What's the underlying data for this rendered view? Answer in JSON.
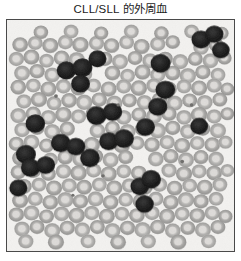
{
  "figure": {
    "caption": "CLL/SLL 的外周血",
    "caption_color": "#1c1c1c",
    "background_color": "#ffffff"
  },
  "micrograph": {
    "name": "peripheral-blood-smear",
    "modality": "light-microscopy",
    "stain": "Wright-Giemsa (grayscale reproduction)",
    "border_color": "#4a4a4a",
    "field_background_color": "#f2f1ef",
    "panel": {
      "x": 6,
      "y": 19,
      "width": 229,
      "height": 233
    },
    "palette": {
      "rbc_rim": "#b0afad",
      "rbc_rim_dark": "#9a9997",
      "rbc_center": "#dedcd9",
      "lymphocyte_dark": "#1e1e1e",
      "lymphocyte_mid": "#2e2e2e",
      "platelet": "#6e6d6b"
    },
    "cell_counts": {
      "erythrocytes": 196,
      "lymphocytes": 24,
      "platelets": 6
    },
    "erythrocytes": [
      [
        14,
        28,
        8.4
      ],
      [
        30,
        26,
        8.0
      ],
      [
        46,
        29,
        8.6
      ],
      [
        62,
        25,
        8.2
      ],
      [
        78,
        28,
        8.8
      ],
      [
        95,
        26,
        8.2
      ],
      [
        111,
        29,
        8.4
      ],
      [
        127,
        25,
        8.0
      ],
      [
        143,
        30,
        8.6
      ],
      [
        160,
        27,
        8.2
      ],
      [
        176,
        25,
        7.8
      ],
      [
        206,
        31,
        8.4
      ],
      [
        222,
        28,
        8.0
      ],
      [
        10,
        44,
        8.2
      ],
      [
        26,
        42,
        8.6
      ],
      [
        42,
        46,
        8.0
      ],
      [
        58,
        43,
        8.4
      ],
      [
        74,
        45,
        8.8
      ],
      [
        104,
        44,
        8.2
      ],
      [
        120,
        47,
        8.6
      ],
      [
        136,
        43,
        8.0
      ],
      [
        152,
        46,
        8.4
      ],
      [
        168,
        44,
        8.2
      ],
      [
        184,
        47,
        8.6
      ],
      [
        200,
        44,
        8.0
      ],
      [
        216,
        46,
        8.4
      ],
      [
        231,
        43,
        7.6
      ],
      [
        16,
        60,
        8.6
      ],
      [
        32,
        58,
        8.2
      ],
      [
        48,
        62,
        8.4
      ],
      [
        64,
        59,
        8.0
      ],
      [
        82,
        61,
        8.6
      ],
      [
        112,
        60,
        8.4
      ],
      [
        128,
        63,
        8.0
      ],
      [
        144,
        59,
        8.6
      ],
      [
        160,
        62,
        8.2
      ],
      [
        176,
        60,
        8.4
      ],
      [
        192,
        63,
        8.8
      ],
      [
        208,
        59,
        8.2
      ],
      [
        224,
        62,
        8.0
      ],
      [
        12,
        76,
        8.4
      ],
      [
        28,
        74,
        8.0
      ],
      [
        44,
        78,
        8.6
      ],
      [
        60,
        75,
        8.2
      ],
      [
        76,
        77,
        8.4
      ],
      [
        92,
        74,
        8.0
      ],
      [
        108,
        78,
        8.6
      ],
      [
        124,
        75,
        8.2
      ],
      [
        140,
        77,
        8.8
      ],
      [
        156,
        74,
        8.2
      ],
      [
        172,
        78,
        8.4
      ],
      [
        188,
        75,
        8.0
      ],
      [
        204,
        77,
        8.6
      ],
      [
        220,
        74,
        8.2
      ],
      [
        234,
        78,
        7.4
      ],
      [
        18,
        92,
        8.2
      ],
      [
        34,
        90,
        8.6
      ],
      [
        50,
        94,
        8.0
      ],
      [
        66,
        91,
        8.4
      ],
      [
        82,
        93,
        8.8
      ],
      [
        98,
        90,
        8.2
      ],
      [
        114,
        94,
        8.6
      ],
      [
        130,
        91,
        8.0
      ],
      [
        146,
        93,
        8.4
      ],
      [
        162,
        90,
        8.2
      ],
      [
        178,
        94,
        8.6
      ],
      [
        194,
        91,
        8.0
      ],
      [
        210,
        93,
        8.4
      ],
      [
        226,
        90,
        8.0
      ],
      [
        12,
        108,
        8.6
      ],
      [
        28,
        106,
        8.2
      ],
      [
        44,
        110,
        8.4
      ],
      [
        60,
        107,
        8.8
      ],
      [
        76,
        109,
        8.2
      ],
      [
        92,
        106,
        8.6
      ],
      [
        124,
        110,
        8.4
      ],
      [
        140,
        107,
        8.0
      ],
      [
        156,
        109,
        8.6
      ],
      [
        172,
        106,
        8.2
      ],
      [
        188,
        110,
        8.4
      ],
      [
        204,
        107,
        8.8
      ],
      [
        220,
        109,
        8.2
      ],
      [
        234,
        106,
        7.4
      ],
      [
        16,
        124,
        8.4
      ],
      [
        32,
        122,
        8.0
      ],
      [
        48,
        126,
        8.6
      ],
      [
        64,
        123,
        8.2
      ],
      [
        96,
        125,
        8.4
      ],
      [
        112,
        122,
        8.0
      ],
      [
        128,
        126,
        8.6
      ],
      [
        144,
        123,
        8.2
      ],
      [
        160,
        125,
        8.8
      ],
      [
        176,
        122,
        8.2
      ],
      [
        192,
        126,
        8.4
      ],
      [
        208,
        123,
        8.0
      ],
      [
        224,
        125,
        8.6
      ],
      [
        10,
        140,
        8.2
      ],
      [
        26,
        138,
        8.6
      ],
      [
        42,
        142,
        8.0
      ],
      [
        58,
        139,
        8.4
      ],
      [
        90,
        141,
        8.8
      ],
      [
        106,
        138,
        8.2
      ],
      [
        122,
        142,
        8.6
      ],
      [
        138,
        139,
        8.0
      ],
      [
        154,
        141,
        8.4
      ],
      [
        170,
        138,
        8.2
      ],
      [
        186,
        142,
        8.6
      ],
      [
        202,
        139,
        8.0
      ],
      [
        218,
        141,
        8.4
      ],
      [
        232,
        138,
        7.6
      ],
      [
        14,
        156,
        8.6
      ],
      [
        46,
        158,
        8.2
      ],
      [
        62,
        155,
        8.4
      ],
      [
        78,
        157,
        8.8
      ],
      [
        94,
        154,
        8.2
      ],
      [
        110,
        158,
        8.6
      ],
      [
        126,
        155,
        8.0
      ],
      [
        158,
        157,
        8.4
      ],
      [
        174,
        154,
        8.2
      ],
      [
        190,
        158,
        8.6
      ],
      [
        206,
        155,
        8.0
      ],
      [
        222,
        157,
        8.4
      ],
      [
        12,
        172,
        8.2
      ],
      [
        28,
        170,
        8.6
      ],
      [
        44,
        174,
        8.0
      ],
      [
        60,
        171,
        8.4
      ],
      [
        76,
        173,
        8.8
      ],
      [
        92,
        170,
        8.2
      ],
      [
        108,
        174,
        8.6
      ],
      [
        124,
        171,
        8.0
      ],
      [
        140,
        173,
        8.4
      ],
      [
        172,
        170,
        8.2
      ],
      [
        188,
        174,
        8.6
      ],
      [
        204,
        171,
        8.0
      ],
      [
        220,
        173,
        8.4
      ],
      [
        234,
        170,
        7.4
      ],
      [
        18,
        188,
        8.4
      ],
      [
        34,
        186,
        8.0
      ],
      [
        50,
        190,
        8.6
      ],
      [
        66,
        187,
        8.2
      ],
      [
        82,
        189,
        8.4
      ],
      [
        98,
        186,
        8.0
      ],
      [
        114,
        190,
        8.6
      ],
      [
        130,
        187,
        8.2
      ],
      [
        146,
        189,
        8.8
      ],
      [
        162,
        186,
        8.2
      ],
      [
        178,
        190,
        8.4
      ],
      [
        194,
        187,
        8.0
      ],
      [
        210,
        189,
        8.6
      ],
      [
        226,
        186,
        8.0
      ],
      [
        14,
        204,
        8.6
      ],
      [
        30,
        202,
        8.2
      ],
      [
        46,
        206,
        8.4
      ],
      [
        62,
        203,
        8.8
      ],
      [
        78,
        205,
        8.2
      ],
      [
        94,
        202,
        8.6
      ],
      [
        110,
        206,
        8.4
      ],
      [
        126,
        203,
        8.0
      ],
      [
        142,
        205,
        8.6
      ],
      [
        158,
        202,
        8.2
      ],
      [
        174,
        206,
        8.4
      ],
      [
        190,
        203,
        8.8
      ],
      [
        206,
        205,
        8.2
      ],
      [
        222,
        202,
        8.0
      ],
      [
        10,
        220,
        8.2
      ],
      [
        26,
        218,
        8.6
      ],
      [
        42,
        222,
        8.0
      ],
      [
        58,
        219,
        8.4
      ],
      [
        74,
        221,
        8.8
      ],
      [
        90,
        218,
        8.2
      ],
      [
        106,
        222,
        8.6
      ],
      [
        122,
        219,
        8.0
      ],
      [
        138,
        221,
        8.4
      ],
      [
        154,
        218,
        8.2
      ],
      [
        170,
        222,
        8.6
      ],
      [
        186,
        219,
        8.0
      ],
      [
        202,
        221,
        8.4
      ],
      [
        218,
        218,
        8.2
      ],
      [
        232,
        222,
        7.6
      ],
      [
        16,
        236,
        8.4
      ],
      [
        32,
        234,
        8.0
      ],
      [
        48,
        238,
        8.6
      ],
      [
        64,
        235,
        8.2
      ],
      [
        80,
        237,
        8.4
      ],
      [
        96,
        234,
        8.0
      ],
      [
        112,
        238,
        8.6
      ],
      [
        128,
        235,
        8.2
      ],
      [
        144,
        237,
        8.8
      ],
      [
        160,
        234,
        8.2
      ],
      [
        176,
        238,
        8.4
      ],
      [
        192,
        235,
        8.0
      ],
      [
        208,
        237,
        8.6
      ],
      [
        224,
        234,
        8.0
      ],
      [
        20,
        250,
        8.2
      ],
      [
        52,
        251,
        8.6
      ],
      [
        86,
        250,
        8.0
      ],
      [
        118,
        251,
        8.4
      ],
      [
        150,
        250,
        8.2
      ],
      [
        182,
        251,
        8.6
      ],
      [
        214,
        250,
        8.0
      ],
      [
        36,
        14,
        7.8
      ],
      [
        68,
        13,
        8.0
      ],
      [
        100,
        15,
        7.6
      ],
      [
        132,
        13,
        8.0
      ],
      [
        164,
        15,
        7.8
      ],
      [
        196,
        13,
        8.0
      ],
      [
        228,
        15,
        7.4
      ]
    ],
    "lymphocytes": [
      [
        63,
        57,
        10.2
      ],
      [
        80,
        54,
        10.6
      ],
      [
        78,
        72,
        10.0
      ],
      [
        30,
        117,
        10.4
      ],
      [
        96,
        44,
        9.6
      ],
      [
        206,
        22,
        10.2
      ],
      [
        220,
        16,
        9.8
      ],
      [
        227,
        34,
        9.4
      ],
      [
        163,
        49,
        10.6
      ],
      [
        168,
        79,
        10.4
      ],
      [
        160,
        98,
        10.2
      ],
      [
        147,
        121,
        10.0
      ],
      [
        95,
        108,
        10.6
      ],
      [
        112,
        104,
        10.2
      ],
      [
        57,
        139,
        10.4
      ],
      [
        73,
        143,
        10.0
      ],
      [
        20,
        152,
        10.6
      ],
      [
        25,
        167,
        10.2
      ],
      [
        41,
        164,
        10.0
      ],
      [
        88,
        156,
        10.4
      ],
      [
        108,
        137,
        10.2
      ],
      [
        124,
        134,
        10.6
      ],
      [
        141,
        188,
        10.0
      ],
      [
        153,
        180,
        10.4
      ],
      [
        146,
        208,
        9.8
      ],
      [
        12,
        190,
        9.6
      ],
      [
        204,
        120,
        9.4
      ]
    ],
    "platelets": [
      [
        52,
        86,
        2.0
      ],
      [
        118,
        96,
        1.8
      ],
      [
        186,
        160,
        2.0
      ],
      [
        70,
        198,
        1.7
      ],
      [
        196,
        96,
        1.9
      ],
      [
        102,
        176,
        1.8
      ]
    ]
  }
}
